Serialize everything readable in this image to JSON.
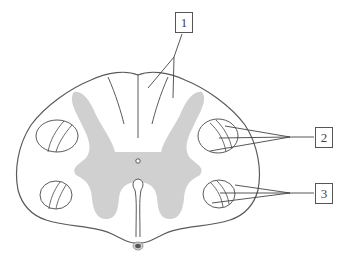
{
  "diagram": {
    "colors": {
      "outline": "#5a5a5a",
      "gray_matter": "#d0d0d0",
      "background": "#ffffff",
      "vessel": "#666666"
    },
    "labels": [
      {
        "id": "1",
        "text": "1",
        "points_to": "posterior columns (dorsal funiculi)"
      },
      {
        "id": "2",
        "text": "2",
        "points_to": "lateral tract bundle"
      },
      {
        "id": "3",
        "text": "3",
        "points_to": "anterior-lateral tract bundle"
      }
    ]
  }
}
